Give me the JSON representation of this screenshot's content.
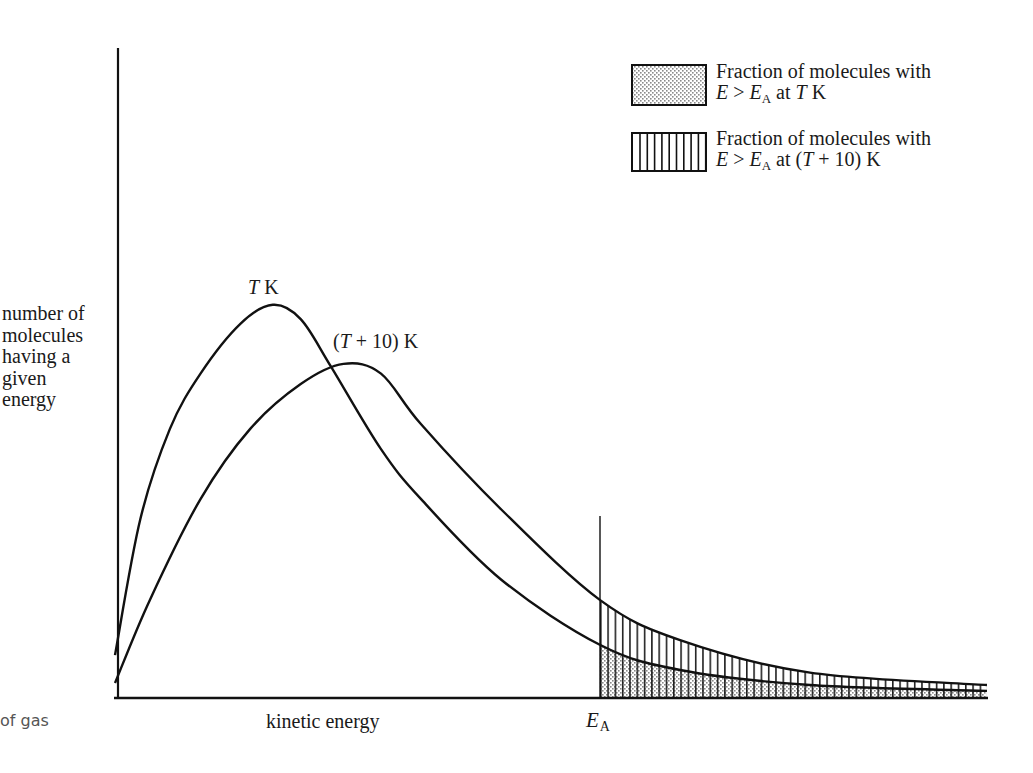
{
  "chart_data": {
    "type": "line",
    "title": "",
    "xlabel": "kinetic energy",
    "ylabel": "number of molecules having a given energy",
    "ylabel_lines": [
      "number of",
      "molecules",
      "having a",
      "given",
      "energy"
    ],
    "x_ticks": [
      {
        "label": "E_A",
        "x": 5.56
      }
    ],
    "grid": false,
    "legend_position": "top-right",
    "xlim": [
      0,
      10
    ],
    "ylim": [
      0,
      100
    ],
    "series": [
      {
        "name": "T K",
        "label": "T K",
        "x": [
          0,
          0.29,
          0.63,
          0.98,
          1.44,
          1.81,
          2.13,
          2.48,
          3.05,
          3.51,
          4.43,
          5.56,
          6.48,
          7.97,
          10.0
        ],
        "y": [
          6.6,
          27.5,
          41.4,
          49.9,
          57.6,
          60.5,
          58.3,
          50.9,
          38.3,
          30.6,
          18.2,
          8.2,
          4.3,
          2.0,
          1.1
        ]
      },
      {
        "name": "(T + 10) K",
        "label": "(T + 10) K",
        "x": [
          0,
          0.4,
          0.98,
          1.55,
          2.13,
          2.62,
          3.05,
          3.51,
          4.43,
          5.56,
          6.48,
          7.97,
          10.0
        ],
        "y": [
          2.3,
          15.1,
          30.6,
          41.4,
          48.3,
          51.4,
          49.9,
          42.1,
          29.0,
          15.1,
          8.9,
          3.9,
          2.0
        ]
      }
    ],
    "annotations": [
      {
        "text": "T K",
        "near": "peak of T K curve"
      },
      {
        "text": "(T + 10) K",
        "near": "peak of (T + 10) K curve"
      },
      {
        "text": "E_A",
        "type": "vertical line",
        "x": 5.56
      }
    ],
    "shaded_regions": [
      {
        "series": "T K",
        "from_x": 5.56,
        "fill": "stipple",
        "meaning": "Fraction of molecules with E > E_A at T K"
      },
      {
        "series": "(T + 10) K",
        "from_x": 5.56,
        "fill": "vertical-hatch",
        "meaning": "Fraction of molecules with E > E_A at (T + 10) K"
      }
    ]
  },
  "labels": {
    "ylabel_lines": [
      "number of",
      "molecules",
      "having a",
      "given",
      "energy"
    ],
    "xlabel": "kinetic energy",
    "clip_caption": "of gas",
    "ea_main": "E",
    "ea_sub": "A",
    "curve_t_var": "T",
    "curve_t_unit": " K",
    "curve_t10_open": "(",
    "curve_t10_var": "T",
    "curve_t10_rest": " + 10) K"
  },
  "legend": [
    {
      "line1": "Fraction of molecules with",
      "e": "E",
      "gt": " > ",
      "ea": "E",
      "ea_sub": "A",
      "at": " at ",
      "temp_open": "",
      "temp_var": "T",
      "temp_rest": " K",
      "pattern": "stipple"
    },
    {
      "line1": "Fraction of molecules with",
      "e": "E",
      "gt": " > ",
      "ea": "E",
      "ea_sub": "A",
      "at": " at ",
      "temp_open": "(",
      "temp_var": "T",
      "temp_rest": " + 10) K",
      "pattern": "vertical-hatch"
    }
  ],
  "colors": {
    "ink": "#111111",
    "stipple": "#bdbdbd",
    "background": "#ffffff"
  }
}
